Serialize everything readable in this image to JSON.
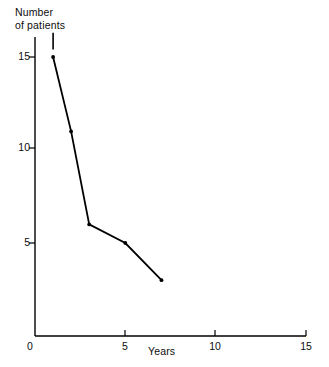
{
  "chart_data": {
    "type": "line",
    "title": "",
    "xlabel": "Years",
    "ylabel": "Number\nof patients",
    "ylabel_line1": "Number",
    "ylabel_line2": "of patients",
    "x": [
      1,
      2,
      3,
      5,
      7
    ],
    "values": [
      15,
      11,
      6,
      5,
      3
    ],
    "series": [
      {
        "name": "Number of patients",
        "x": [
          1,
          2,
          3,
          5,
          7
        ],
        "values": [
          15,
          11,
          6,
          5,
          3
        ]
      }
    ],
    "xlim": [
      0,
      15
    ],
    "ylim": [
      0,
      16.5
    ],
    "xticks": [
      0,
      5,
      10,
      15
    ],
    "xtick_labels": [
      "0",
      "5",
      "10",
      "15"
    ],
    "yticks": [
      5,
      10,
      15
    ],
    "ytick_labels": [
      "5",
      "10",
      "15"
    ],
    "grid": false,
    "legend": false,
    "marker": "dot",
    "line_color": "#000000",
    "axis_color": "#000000",
    "annotations": [
      {
        "kind": "vertical-tick",
        "x": 1,
        "y_from": 15.4,
        "y_to": 16.3,
        "note": "short vertical stub above first data point"
      }
    ]
  },
  "axis": {
    "origin_label": "0",
    "x_tick_5": "5",
    "x_tick_10": "10",
    "x_tick_15": "15",
    "y_tick_5": "5",
    "y_tick_10": "10",
    "y_tick_15": "15"
  }
}
